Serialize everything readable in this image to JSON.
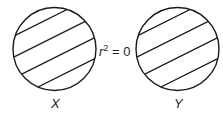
{
  "diagram": {
    "circles": [
      {
        "id": "X",
        "label": "X",
        "cx": 54.5,
        "cy": 49,
        "r": 41.5,
        "hatched": true
      },
      {
        "id": "Y",
        "label": "Y",
        "cx": 177.5,
        "cy": 49,
        "r": 41.5,
        "hatched": true
      }
    ],
    "relation": {
      "var": "r",
      "exp": "2",
      "rest": " = 0"
    },
    "stroke_color": "#1a1a1a",
    "background": "#ffffff"
  }
}
